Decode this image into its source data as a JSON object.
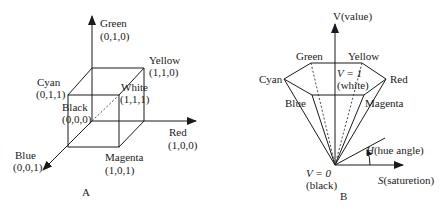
{
  "figure_a": {
    "caption": "A",
    "title": "RGB color cube",
    "vertices": {
      "green": {
        "name": "Green",
        "coords": "(0,1,0)"
      },
      "yellow": {
        "name": "Yellow",
        "coords": "(1,1,0)"
      },
      "cyan": {
        "name": "Cyan",
        "coords": "(0,1,1)"
      },
      "white": {
        "name": "White",
        "coords": "(1,1,1)"
      },
      "black": {
        "name": "Black",
        "coords": "(0,0,0)"
      },
      "red": {
        "name": "Red",
        "coords": "(1,0,0)"
      },
      "blue": {
        "name": "Blue",
        "coords": "(0,0,1)"
      },
      "magenta": {
        "name": "Magenta",
        "coords": "(1,0,1)"
      }
    }
  },
  "figure_b": {
    "caption": "B",
    "title": "HSV hexcone",
    "axis_v": "V(value)",
    "top_label_eq": "V = 1",
    "top_label_sub": "(white)",
    "bottom_label_eq": "V = 0",
    "bottom_label_sub": "(black)",
    "hue_label_var": "H",
    "hue_label_rest": "(hue angle)",
    "sat_label_var": "S",
    "sat_label_rest": "(saturetion)",
    "vertices": {
      "green": "Green",
      "yellow": "Yellow",
      "cyan": "Cyan",
      "red": "Red",
      "blue": "Blue",
      "magenta": "Magenta"
    }
  }
}
